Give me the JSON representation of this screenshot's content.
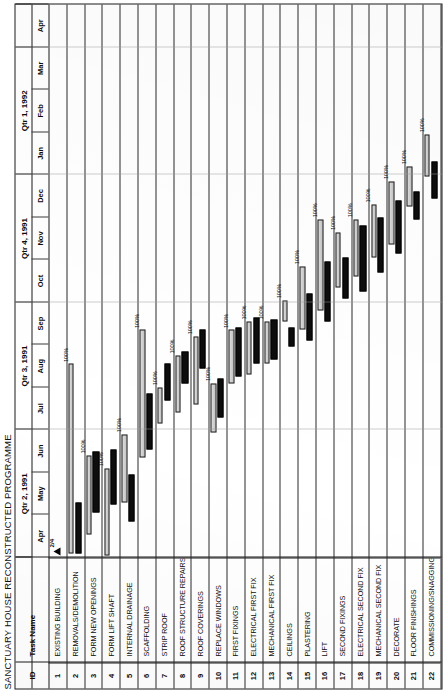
{
  "document": {
    "title": "SANCTUARY HOUSE RECONSTRUCTED PROGRAMME"
  },
  "columns": {
    "id_header": "ID",
    "task_header": "Task Name"
  },
  "timeline": {
    "quarters": [
      {
        "label": "Qtr 2, 1991",
        "span": 3
      },
      {
        "label": "Qtr 3, 1991",
        "span": 3
      },
      {
        "label": "Qtr 4, 1991",
        "span": 3
      },
      {
        "label": "Qtr 1, 1992",
        "span": 3
      },
      {
        "label": "",
        "span": 1
      }
    ],
    "months": [
      "Apr",
      "May",
      "Jun",
      "Jul",
      "Aug",
      "Sep",
      "Oct",
      "Nov",
      "Dec",
      "Jan",
      "Feb",
      "Mar",
      "Apr"
    ]
  },
  "milestone": {
    "label": "2/4",
    "month_index": 0.05
  },
  "legend": {
    "planned_color": "#c9c9c9",
    "actual_color": "#0d0d0d"
  },
  "chart_data": {
    "type": "bar",
    "title": "SANCTUARY HOUSE RECONSTRUCTED PROGRAMME",
    "xlabel": "",
    "ylabel": "Task Name",
    "categories": [
      "EXISTING BUILDING",
      "REMOVALS/DEMOLITION",
      "FORM NEW OPENINGS",
      "FORM LIFT SHAFT",
      "INTERNAL DRAINAGE",
      "SCAFFOLDING",
      "STRIP ROOF",
      "ROOF STRUCTURE REPAIRS",
      "ROOF COVERINGS",
      "REPLACE WINDOWS",
      "FIRST FIXINGS",
      "ELECTRICAL FIRST FIX",
      "MECHANICAL FIRST FIX",
      "CEILINGS",
      "PLASTERING",
      "LIFT",
      "SECOND FIXINGS",
      "ELECTRICAL SECOND FIX",
      "MECHANICAL SECOND FIX",
      "DECORATE",
      "FLOOR FINISHINGS",
      "COMMISSIONING/SNAGGING"
    ],
    "axis_months": [
      "Apr",
      "May",
      "Jun",
      "Jul",
      "Aug",
      "Sep",
      "Oct",
      "Nov",
      "Dec",
      "Jan",
      "Feb",
      "Mar",
      "Apr"
    ],
    "axis_quarters": [
      "Qtr 2, 1991",
      "Qtr 3, 1991",
      "Qtr 4, 1991",
      "Qtr 1, 1992"
    ],
    "series": [
      {
        "name": "Planned",
        "color": "#c9c9c9"
      },
      {
        "name": "Actual",
        "color": "#0d0d0d"
      }
    ],
    "tasks": [
      {
        "id": "1",
        "name": "EXISTING BUILDING",
        "milestone": true,
        "milestone_label": "2/4",
        "milestone_at": 0.05,
        "plan": null,
        "actual": null,
        "pct": ""
      },
      {
        "id": "2",
        "name": "REMOVALS/DEMOLITION",
        "milestone": false,
        "plan": [
          0.1,
          4.55
        ],
        "actual": [
          0.1,
          1.3
        ],
        "pct": "100%"
      },
      {
        "id": "3",
        "name": "FORM NEW OPENINGS",
        "milestone": false,
        "plan": [
          0.55,
          2.4
        ],
        "actual": [
          1.05,
          2.5
        ],
        "pct": "100%"
      },
      {
        "id": "4",
        "name": "FORM LIFT SHAFT",
        "milestone": false,
        "plan": [
          0.05,
          2.1
        ],
        "actual": [
          1.25,
          2.55
        ],
        "pct": "100%"
      },
      {
        "id": "5",
        "name": "INTERNAL DRAINAGE",
        "milestone": false,
        "plan": [
          1.3,
          2.9
        ],
        "actual": [
          0.85,
          1.95
        ],
        "pct": "100%"
      },
      {
        "id": "6",
        "name": "SCAFFOLDING",
        "milestone": false,
        "plan": [
          2.35,
          5.35
        ],
        "actual": [
          2.55,
          3.85
        ],
        "pct": "100%"
      },
      {
        "id": "7",
        "name": "STRIP ROOF",
        "milestone": false,
        "plan": [
          3.15,
          4.0
        ],
        "actual": [
          3.7,
          4.55
        ],
        "pct": "100%"
      },
      {
        "id": "8",
        "name": "ROOF STRUCTURE REPAIRS",
        "milestone": false,
        "plan": [
          3.4,
          4.75
        ],
        "actual": [
          4.1,
          4.85
        ],
        "pct": "100%"
      },
      {
        "id": "9",
        "name": "ROOF COVERINGS",
        "milestone": false,
        "plan": [
          3.6,
          5.2
        ],
        "actual": [
          4.45,
          5.35
        ],
        "pct": "100%"
      },
      {
        "id": "10",
        "name": "REPLACE WINDOWS",
        "milestone": false,
        "plan": [
          2.95,
          4.1
        ],
        "actual": [
          3.3,
          4.2
        ],
        "pct": "100%"
      },
      {
        "id": "11",
        "name": "FIRST FIXINGS",
        "milestone": false,
        "plan": [
          4.1,
          5.35
        ],
        "actual": [
          4.25,
          5.4
        ],
        "pct": "100%"
      },
      {
        "id": "12",
        "name": "ELECTRICAL FIRST FIX",
        "milestone": false,
        "plan": [
          4.3,
          5.55
        ],
        "actual": [
          4.55,
          5.65
        ],
        "pct": "100%"
      },
      {
        "id": "13",
        "name": "MECHANICAL FIRST FIX",
        "milestone": false,
        "plan": [
          4.55,
          5.55
        ],
        "actual": [
          4.65,
          5.6
        ],
        "pct": "100%"
      },
      {
        "id": "14",
        "name": "CEILINGS",
        "milestone": false,
        "plan": [
          5.55,
          6.05
        ],
        "actual": [
          4.95,
          5.4
        ],
        "pct": "100%"
      },
      {
        "id": "15",
        "name": "PLASTERING",
        "milestone": false,
        "plan": [
          5.35,
          6.85
        ],
        "actual": [
          5.1,
          6.2
        ],
        "pct": "100%"
      },
      {
        "id": "16",
        "name": "LIFT",
        "milestone": false,
        "plan": [
          5.8,
          7.95
        ],
        "actual": [
          5.55,
          6.95
        ],
        "pct": "100%"
      },
      {
        "id": "17",
        "name": "SECOND FIXINGS",
        "milestone": false,
        "plan": [
          6.35,
          7.65
        ],
        "actual": [
          6.1,
          7.05
        ],
        "pct": "100%"
      },
      {
        "id": "18",
        "name": "ELECTRICAL SECOND FIX",
        "milestone": false,
        "plan": [
          6.6,
          7.95
        ],
        "actual": [
          6.25,
          7.8
        ],
        "pct": "100%"
      },
      {
        "id": "19",
        "name": "MECHANICAL SECOND FIX",
        "milestone": false,
        "plan": [
          7.05,
          8.3
        ],
        "actual": [
          6.7,
          8.0
        ],
        "pct": "100%"
      },
      {
        "id": "20",
        "name": "DECORATE",
        "milestone": false,
        "plan": [
          7.35,
          8.85
        ],
        "actual": [
          7.15,
          8.4
        ],
        "pct": "100%"
      },
      {
        "id": "21",
        "name": "FLOOR FINISHINGS",
        "milestone": false,
        "plan": [
          8.25,
          9.2
        ],
        "actual": [
          7.95,
          8.6
        ],
        "pct": "100%"
      },
      {
        "id": "22",
        "name": "COMMISSIONING/SNAGGING",
        "milestone": false,
        "plan": [
          8.95,
          9.95
        ],
        "actual": [
          8.45,
          9.3
        ],
        "pct": "100%"
      }
    ],
    "grid": true,
    "legend_position": "none"
  }
}
